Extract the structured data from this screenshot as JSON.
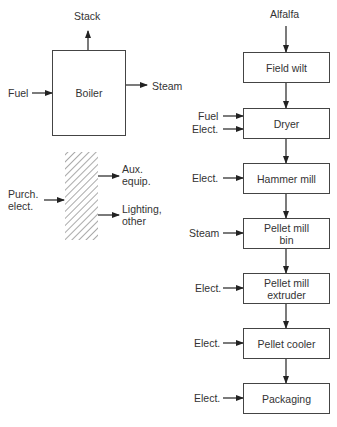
{
  "boiler": {
    "box_label": "Boiler",
    "inputs": [
      "Fuel"
    ],
    "outputs": [
      "Stack",
      "Steam"
    ]
  },
  "electric": {
    "input": "Purch. elect.",
    "input_lines": [
      "Purch.",
      "elect."
    ],
    "outputs": [
      {
        "lines": [
          "Aux.",
          "equip."
        ]
      },
      {
        "lines": [
          "Lighting,",
          "other"
        ]
      }
    ]
  },
  "process": {
    "feed": "Alfalfa",
    "steps": [
      {
        "label": "Field wilt",
        "inputs": []
      },
      {
        "label": "Dryer",
        "inputs": [
          "Fuel",
          "Elect."
        ]
      },
      {
        "label": "Hammer mill",
        "inputs": [
          "Elect."
        ]
      },
      {
        "label_lines": [
          "Pellet mill",
          "bin"
        ],
        "inputs": [
          "Steam"
        ]
      },
      {
        "label_lines": [
          "Pellet mill",
          "extruder"
        ],
        "inputs": [
          "Elect."
        ]
      },
      {
        "label": "Pellet cooler",
        "inputs": [
          "Elect."
        ]
      },
      {
        "label": "Packaging",
        "inputs": [
          "Elect."
        ]
      }
    ]
  }
}
